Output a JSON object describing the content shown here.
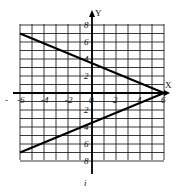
{
  "chart_data": {
    "type": "line",
    "title": "",
    "xlabel": "X",
    "ylabel": "Y",
    "xlim": [
      -6,
      6
    ],
    "ylim": [
      -8,
      8
    ],
    "grid": true,
    "x_ticks": [
      "-6",
      "-4",
      "-2",
      "0",
      "2",
      "4",
      "6"
    ],
    "y_ticks": [
      "8",
      "6",
      "4",
      "2",
      "0",
      "-2",
      "-4",
      "-6",
      "-8"
    ],
    "x_tick_values": [
      -6,
      -4,
      -2,
      0,
      2,
      4,
      6
    ],
    "y_tick_values": [
      8,
      6,
      4,
      2,
      -2,
      -4,
      -6,
      -8
    ],
    "series": [
      {
        "name": "upper line",
        "x": [
          -6,
          6
        ],
        "y": [
          7,
          0
        ]
      },
      {
        "name": "lower line",
        "x": [
          -6,
          6
        ],
        "y": [
          -7,
          0
        ]
      }
    ],
    "footer_mark": "i"
  }
}
